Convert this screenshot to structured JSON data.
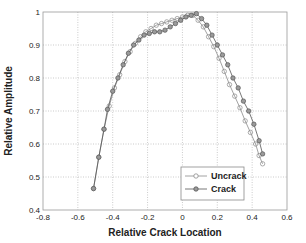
{
  "chart_data": {
    "type": "line",
    "title": "",
    "xlabel": "Relative Crack Location",
    "ylabel": "Relative Amplitude",
    "xlim": [
      -0.8,
      0.6
    ],
    "ylim": [
      0.4,
      1.0
    ],
    "xticks": [
      -0.8,
      -0.6,
      -0.4,
      -0.2,
      0,
      0.2,
      0.4,
      0.6
    ],
    "xtick_labels": [
      "-0.8",
      "-0.6",
      "-0.4",
      "-0.2",
      "0",
      "0.2",
      "0.4",
      "0.6"
    ],
    "yticks": [
      0.4,
      0.5,
      0.6,
      0.7,
      0.8,
      0.9,
      1.0
    ],
    "ytick_labels": [
      "0.4",
      "0.5",
      "0.6",
      "0.7",
      "0.8",
      "0.9",
      "1"
    ],
    "grid": true,
    "legend_position": "lower right",
    "series": [
      {
        "name": "Uncrack",
        "marker": "open-circle",
        "color": "#8a8a8a",
        "x": [
          -0.51,
          -0.48,
          -0.45,
          -0.42,
          -0.39,
          -0.36,
          -0.33,
          -0.3,
          -0.27,
          -0.24,
          -0.21,
          -0.18,
          -0.15,
          -0.12,
          -0.09,
          -0.06,
          -0.03,
          0.0,
          0.03,
          0.06,
          0.09,
          0.12,
          0.15,
          0.18,
          0.21,
          0.24,
          0.27,
          0.3,
          0.33,
          0.36,
          0.39,
          0.42,
          0.44,
          0.46
        ],
        "y": [
          0.465,
          0.56,
          0.645,
          0.715,
          0.77,
          0.81,
          0.85,
          0.88,
          0.905,
          0.925,
          0.94,
          0.95,
          0.96,
          0.965,
          0.97,
          0.975,
          0.98,
          0.985,
          0.99,
          0.99,
          0.975,
          0.955,
          0.925,
          0.895,
          0.86,
          0.82,
          0.78,
          0.745,
          0.71,
          0.67,
          0.635,
          0.6,
          0.565,
          0.54
        ]
      },
      {
        "name": "Crack",
        "marker": "filled-circle",
        "color": "#555555",
        "x": [
          -0.51,
          -0.48,
          -0.45,
          -0.43,
          -0.4,
          -0.37,
          -0.34,
          -0.31,
          -0.28,
          -0.25,
          -0.22,
          -0.19,
          -0.16,
          -0.13,
          -0.1,
          -0.07,
          -0.04,
          -0.01,
          0.02,
          0.05,
          0.08,
          0.11,
          0.14,
          0.17,
          0.2,
          0.23,
          0.26,
          0.29,
          0.32,
          0.35,
          0.38,
          0.41,
          0.44,
          0.46
        ],
        "y": [
          0.465,
          0.56,
          0.645,
          0.705,
          0.76,
          0.8,
          0.84,
          0.875,
          0.9,
          0.915,
          0.93,
          0.935,
          0.94,
          0.94,
          0.945,
          0.955,
          0.965,
          0.975,
          0.985,
          0.99,
          0.995,
          0.98,
          0.96,
          0.93,
          0.9,
          0.87,
          0.84,
          0.8,
          0.77,
          0.73,
          0.7,
          0.66,
          0.61,
          0.57
        ]
      }
    ]
  }
}
